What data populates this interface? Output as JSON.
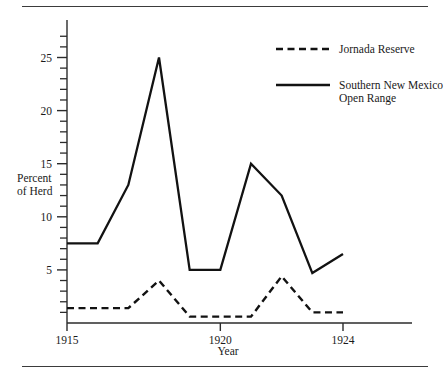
{
  "chart_data": {
    "type": "line",
    "title": "",
    "xlabel": "Year",
    "ylabel": "Percent of Herd",
    "ylabel_line1": "Percent",
    "ylabel_line2": "of Herd",
    "x": [
      1915,
      1916,
      1917,
      1918,
      1919,
      1920,
      1921,
      1922,
      1923,
      1924
    ],
    "xlim": [
      1915,
      1924
    ],
    "ylim": [
      0,
      28
    ],
    "grid": false,
    "legend_position": "top-right",
    "xticks": [
      {
        "value": 1915,
        "label": "1915"
      },
      {
        "value": 1920,
        "label": "1920"
      },
      {
        "value": 1924,
        "label": "1924"
      }
    ],
    "yticks_major": [
      {
        "value": 5,
        "label": "5"
      },
      {
        "value": 10,
        "label": "10"
      },
      {
        "value": 15,
        "label": "15"
      },
      {
        "value": 20,
        "label": "20"
      },
      {
        "value": 25,
        "label": "25"
      }
    ],
    "yticks_minor": [
      1,
      2,
      3,
      4,
      6,
      7,
      8,
      9,
      11,
      12,
      13,
      14,
      16,
      17,
      18,
      19,
      21,
      22,
      23,
      24,
      26,
      27
    ],
    "series": [
      {
        "name": "Jornada Reserve",
        "style": "dashed",
        "color": "#121212",
        "values": [
          1.4,
          1.4,
          1.4,
          4.0,
          0.6,
          0.6,
          0.6,
          4.4,
          1.0,
          1.0
        ]
      },
      {
        "name": "Southern New Mexico Open Range",
        "name_line1": "Southern New Mexico",
        "name_line2": "Open Range",
        "style": "solid",
        "color": "#121212",
        "values": [
          7.5,
          7.5,
          13.0,
          25.0,
          5.0,
          5.0,
          15.0,
          12.0,
          4.7,
          6.5
        ]
      }
    ]
  },
  "legend": {
    "entries": [
      {
        "label": "Jornada Reserve",
        "style": "dashed"
      },
      {
        "label_line1": "Southern New Mexico",
        "label_line2": "Open Range",
        "style": "solid"
      }
    ]
  }
}
